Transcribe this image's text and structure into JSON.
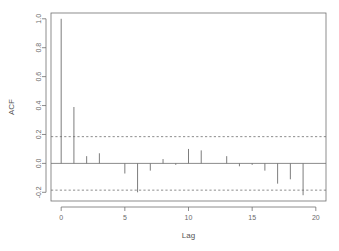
{
  "chart_data": {
    "type": "bar",
    "title": "",
    "xlabel": "Lag",
    "ylabel": "ACF",
    "categories": [
      0,
      1,
      2,
      3,
      4,
      5,
      6,
      7,
      8,
      9,
      10,
      11,
      12,
      13,
      14,
      15,
      16,
      17,
      18,
      19,
      20
    ],
    "values": [
      1.0,
      0.39,
      0.05,
      0.07,
      0.0,
      -0.07,
      -0.2,
      -0.05,
      0.03,
      -0.01,
      0.1,
      0.09,
      0.0,
      0.05,
      -0.02,
      -0.01,
      -0.05,
      -0.14,
      -0.11,
      -0.22,
      0.0
    ],
    "series": [
      {
        "name": "ACF",
        "values": [
          1.0,
          0.39,
          0.05,
          0.07,
          0.0,
          -0.07,
          -0.2,
          -0.05,
          0.03,
          -0.01,
          0.1,
          0.09,
          0.0,
          0.05,
          -0.02,
          -0.01,
          -0.05,
          -0.14,
          -0.11,
          -0.22,
          0.0
        ]
      }
    ],
    "xlim": [
      -0.8,
      20.8
    ],
    "ylim": [
      -0.26,
      1.04
    ],
    "xticks": [
      0,
      5,
      10,
      15,
      20
    ],
    "xtick_labels": [
      "0",
      "5",
      "10",
      "15",
      "20"
    ],
    "yticks": [
      -0.2,
      0.0,
      0.2,
      0.4,
      0.6,
      0.8,
      1.0
    ],
    "ytick_labels": [
      "-0.2",
      "0.0",
      "0.2",
      "0.4",
      "0.6",
      "0.8",
      "1.0"
    ],
    "grid": false,
    "legend": "none",
    "confidence_bounds": [
      0.185,
      -0.185
    ],
    "zero_reference": 0.0,
    "stem_color": "#6e6e6e",
    "axis_color": "#707070",
    "background_color": "#ffffff"
  },
  "axis": {
    "y_title": "ACF",
    "x_title": "Lag"
  }
}
